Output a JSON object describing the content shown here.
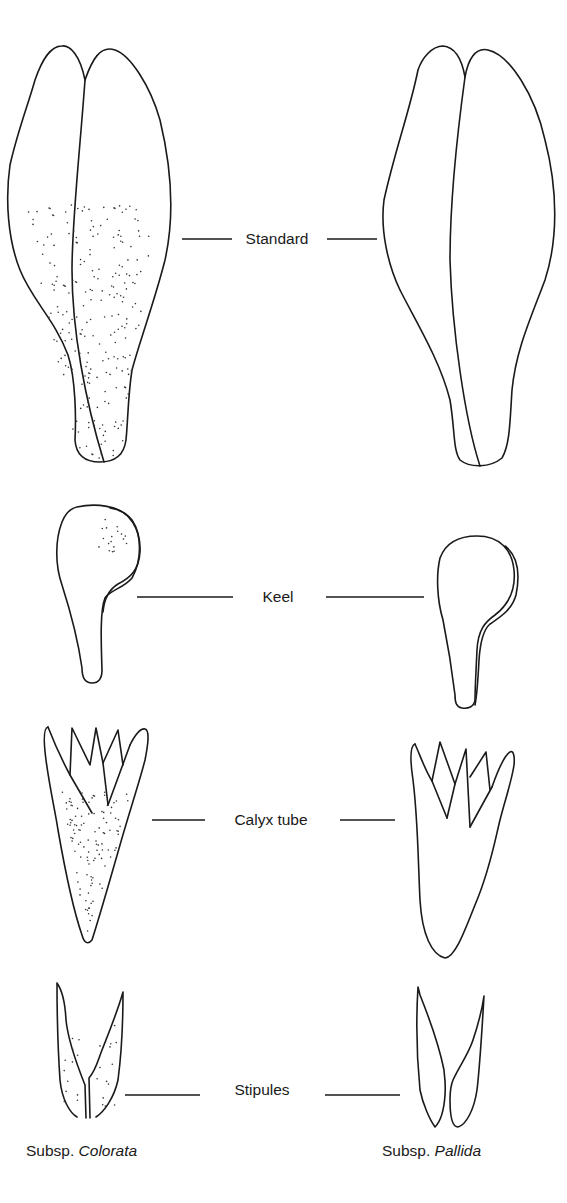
{
  "figure": {
    "parts": [
      {
        "id": "standard",
        "label": "Standard"
      },
      {
        "id": "keel",
        "label": "Keel"
      },
      {
        "id": "calyx",
        "label": "Calyx tube"
      },
      {
        "id": "stipules",
        "label": "Stipules"
      }
    ],
    "subspecies": [
      {
        "prefix": "Subsp.",
        "name": "Colorata",
        "stippled": true
      },
      {
        "prefix": "Subsp.",
        "name": "Pallida",
        "stippled": false
      }
    ]
  }
}
